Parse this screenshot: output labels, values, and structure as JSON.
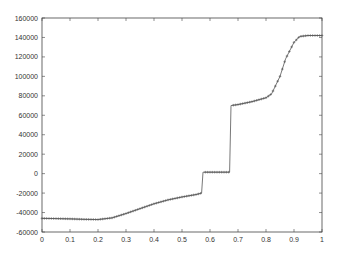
{
  "chart_data": {
    "type": "line",
    "title": "",
    "xlabel": "",
    "ylabel": "",
    "xlim": [
      0,
      1
    ],
    "ylim": [
      -60000,
      160000
    ],
    "grid": false,
    "legend": null,
    "x_ticks": [
      "0",
      "0.1",
      "0.2",
      "0.3",
      "0.4",
      "0.5",
      "0.6",
      "0.7",
      "0.8",
      "0.9",
      "1"
    ],
    "y_ticks": [
      "-60000",
      "-40000",
      "-20000",
      "0",
      "20000",
      "40000",
      "60000",
      "80000",
      "100000",
      "120000",
      "140000",
      "160000"
    ],
    "series": [
      {
        "name": "solution",
        "marker": "+",
        "color": "#555555",
        "x": [
          0,
          0.05,
          0.1,
          0.15,
          0.2,
          0.25,
          0.3,
          0.35,
          0.4,
          0.45,
          0.5,
          0.55,
          0.57,
          0.575,
          0.6,
          0.65,
          0.67,
          0.675,
          0.7,
          0.75,
          0.8,
          0.82,
          0.85,
          0.87,
          0.9,
          0.92,
          0.95,
          1.0
        ],
        "y": [
          -46000,
          -46200,
          -46500,
          -47000,
          -47200,
          -45500,
          -41000,
          -36000,
          -31000,
          -27000,
          -24000,
          -21500,
          -20000,
          1500,
          1500,
          1500,
          1500,
          70000,
          71000,
          74000,
          78000,
          82000,
          100000,
          118000,
          135000,
          141000,
          142000,
          142000
        ]
      }
    ]
  }
}
